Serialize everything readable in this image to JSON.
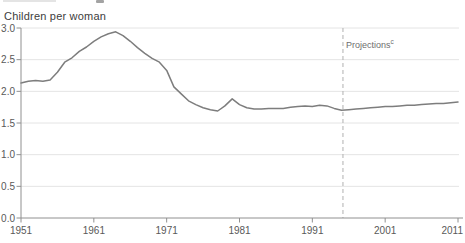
{
  "chart": {
    "unit_label": "Children per woman",
    "annotation": {
      "label": "Projections",
      "sup": "c",
      "year": 1995
    }
  },
  "colors": {
    "line": "#7d7d7d",
    "grid": "#e4e4e4",
    "axis": "#909090",
    "tick_text": "#595959",
    "dashed_divider": "#b0b0b0",
    "title_text": "#3d3d3d",
    "annotation_text": "#6e6e6e",
    "background": "#ffffff"
  },
  "chart_data": {
    "type": "line",
    "title": "Children per woman",
    "ylabel": "Children per woman",
    "xlim": [
      1951,
      2011
    ],
    "ylim": [
      0,
      3
    ],
    "grid": true,
    "legend": "none",
    "x_ticks": [
      1951,
      1961,
      1971,
      1981,
      1991,
      2001,
      2011
    ],
    "y_tick_labels": [
      "0.0",
      "0.5",
      "1.0",
      "1.5",
      "2.0",
      "2.5",
      "3.0"
    ],
    "projection_divider_year": 1995,
    "series": [
      {
        "name": "Children per woman",
        "x": [
          1951,
          1952,
          1953,
          1954,
          1955,
          1956,
          1957,
          1958,
          1959,
          1960,
          1961,
          1962,
          1963,
          1964,
          1965,
          1966,
          1967,
          1968,
          1969,
          1970,
          1971,
          1972,
          1973,
          1974,
          1975,
          1976,
          1977,
          1978,
          1979,
          1980,
          1981,
          1982,
          1983,
          1984,
          1985,
          1986,
          1987,
          1988,
          1989,
          1990,
          1991,
          1992,
          1993,
          1994,
          1995,
          1996,
          1997,
          1998,
          1999,
          2000,
          2001,
          2002,
          2003,
          2004,
          2005,
          2006,
          2007,
          2008,
          2009,
          2010,
          2011
        ],
        "y": [
          2.13,
          2.16,
          2.17,
          2.16,
          2.18,
          2.3,
          2.46,
          2.53,
          2.63,
          2.7,
          2.79,
          2.86,
          2.91,
          2.94,
          2.88,
          2.79,
          2.69,
          2.6,
          2.52,
          2.46,
          2.33,
          2.07,
          1.96,
          1.85,
          1.79,
          1.74,
          1.71,
          1.69,
          1.77,
          1.88,
          1.79,
          1.74,
          1.72,
          1.72,
          1.73,
          1.73,
          1.73,
          1.75,
          1.76,
          1.77,
          1.76,
          1.78,
          1.77,
          1.73,
          1.7,
          1.71,
          1.72,
          1.73,
          1.74,
          1.75,
          1.76,
          1.76,
          1.77,
          1.78,
          1.78,
          1.79,
          1.8,
          1.81,
          1.81,
          1.82,
          1.83
        ]
      }
    ]
  }
}
